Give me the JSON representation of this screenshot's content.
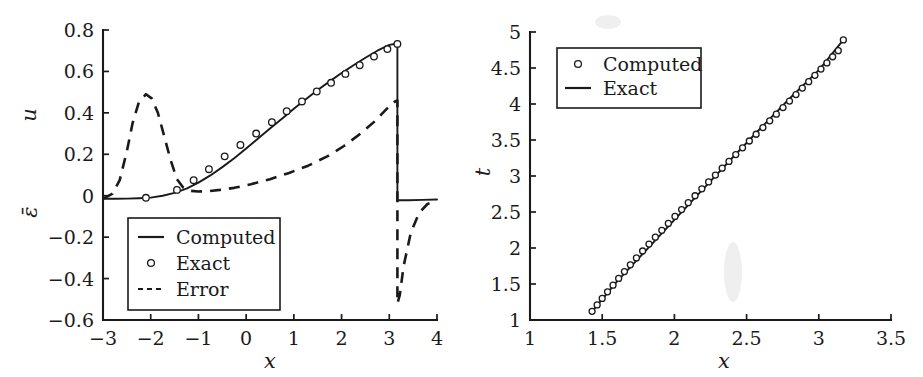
{
  "figure": {
    "background": "#ffffff",
    "ink": "#1a1a1a",
    "panel_count": 2
  },
  "chart_data": [
    {
      "type": "line",
      "panel": "left",
      "title": "",
      "xlabel": "x",
      "ylabel": "u",
      "ylabel_secondary": "ε̄",
      "xlim": [
        -3,
        4
      ],
      "ylim": [
        -0.6,
        0.8
      ],
      "xticks": [
        -3,
        -2,
        -1,
        0,
        1,
        2,
        3,
        4
      ],
      "xticklabels": [
        "−3",
        "−2",
        "−1",
        "0",
        "1",
        "2",
        "3",
        "4"
      ],
      "yticks": [
        -0.6,
        -0.4,
        -0.2,
        0,
        0.2,
        0.4,
        0.6,
        0.8
      ],
      "yticklabels": [
        "−0.6",
        "−0.4",
        "−0.2",
        "0",
        "0.2",
        "0.4",
        "0.6",
        "0.8"
      ],
      "grid": false,
      "legend_position": "lower-left",
      "series": [
        {
          "name": "Computed",
          "style": "solid",
          "marker": "none",
          "x": [
            -3.0,
            -2.75,
            -2.5,
            -2.25,
            -2.0,
            -1.75,
            -1.5,
            -1.25,
            -1.0,
            -0.75,
            -0.5,
            -0.25,
            0.0,
            0.25,
            0.5,
            0.75,
            1.0,
            1.25,
            1.5,
            1.75,
            2.0,
            2.25,
            2.5,
            2.75,
            3.0,
            3.17,
            3.17,
            3.4,
            3.7,
            4.0
          ],
          "y": [
            -0.015,
            -0.015,
            -0.014,
            -0.012,
            -0.009,
            0.0,
            0.014,
            0.034,
            0.063,
            0.098,
            0.138,
            0.181,
            0.228,
            0.276,
            0.324,
            0.372,
            0.42,
            0.466,
            0.51,
            0.552,
            0.592,
            0.63,
            0.666,
            0.7,
            0.728,
            0.735,
            -0.022,
            -0.022,
            -0.02,
            -0.018
          ]
        },
        {
          "name": "Exact",
          "style": "none",
          "marker": "circle",
          "x": [
            -2.1,
            -1.45,
            -1.1,
            -0.78,
            -0.45,
            -0.12,
            0.21,
            0.54,
            0.85,
            1.17,
            1.48,
            1.78,
            2.08,
            2.38,
            2.68,
            2.96,
            3.17
          ],
          "y": [
            -0.01,
            0.028,
            0.075,
            0.128,
            0.19,
            0.245,
            0.3,
            0.355,
            0.408,
            0.455,
            0.503,
            0.545,
            0.588,
            0.63,
            0.672,
            0.708,
            0.733
          ]
        },
        {
          "name": "Error",
          "style": "dashed",
          "marker": "none",
          "x": [
            -3.0,
            -2.8,
            -2.65,
            -2.5,
            -2.38,
            -2.25,
            -2.1,
            -1.98,
            -1.85,
            -1.72,
            -1.58,
            -1.45,
            -1.32,
            -1.18,
            -1.0,
            -0.8,
            -0.55,
            -0.25,
            0.1,
            0.5,
            0.9,
            1.3,
            1.7,
            2.05,
            2.4,
            2.7,
            2.95,
            3.12,
            3.17,
            3.17,
            3.22,
            3.3,
            3.45,
            3.62,
            3.8,
            4.0
          ],
          "y": [
            -0.015,
            0.01,
            0.075,
            0.215,
            0.35,
            0.45,
            0.49,
            0.47,
            0.4,
            0.29,
            0.17,
            0.08,
            0.04,
            0.024,
            0.02,
            0.022,
            0.028,
            0.038,
            0.055,
            0.08,
            0.11,
            0.145,
            0.19,
            0.24,
            0.3,
            0.36,
            0.42,
            0.455,
            0.46,
            -0.52,
            -0.48,
            -0.34,
            -0.18,
            -0.085,
            -0.04,
            -0.025
          ]
        }
      ]
    },
    {
      "type": "line",
      "panel": "right",
      "title": "",
      "xlabel": "x",
      "ylabel": "t",
      "xlim": [
        1,
        3.5
      ],
      "ylim": [
        1,
        5
      ],
      "xticks": [
        1,
        1.5,
        2,
        2.5,
        3,
        3.5
      ],
      "xticklabels": [
        "1",
        "1.5",
        "2",
        "2.5",
        "3",
        "3.5"
      ],
      "yticks": [
        1,
        1.5,
        2,
        2.5,
        3,
        3.5,
        4,
        4.5,
        5
      ],
      "yticklabels": [
        "1",
        "1.5",
        "2",
        "2.5",
        "3",
        "3.5",
        "4",
        "4.5",
        "5"
      ],
      "grid": false,
      "legend_position": "upper-left",
      "series": [
        {
          "name": "Computed",
          "style": "none",
          "marker": "circle",
          "x": [
            1.43,
            1.465,
            1.5,
            1.537,
            1.575,
            1.614,
            1.654,
            1.695,
            1.737,
            1.78,
            1.824,
            1.868,
            1.913,
            1.958,
            2.004,
            2.05,
            2.096,
            2.143,
            2.19,
            2.237,
            2.284,
            2.331,
            2.378,
            2.425,
            2.472,
            2.519,
            2.566,
            2.613,
            2.66,
            2.706,
            2.752,
            2.797,
            2.842,
            2.886,
            2.93,
            2.973,
            3.015,
            3.056,
            3.096,
            3.135,
            3.17
          ],
          "y": [
            1.12,
            1.21,
            1.3,
            1.392,
            1.484,
            1.578,
            1.672,
            1.767,
            1.862,
            1.958,
            2.054,
            2.15,
            2.246,
            2.342,
            2.438,
            2.534,
            2.63,
            2.726,
            2.822,
            2.918,
            3.013,
            3.108,
            3.203,
            3.298,
            3.392,
            3.486,
            3.58,
            3.673,
            3.766,
            3.858,
            3.95,
            4.041,
            4.131,
            4.221,
            4.31,
            4.398,
            4.485,
            4.571,
            4.656,
            4.74,
            4.89
          ]
        },
        {
          "name": "Exact",
          "style": "solid",
          "marker": "none",
          "x": [
            1.43,
            1.6,
            1.8,
            2.0,
            2.2,
            2.4,
            2.6,
            2.8,
            3.0,
            3.17
          ],
          "y": [
            1.12,
            1.53,
            1.96,
            2.39,
            2.82,
            3.25,
            3.67,
            4.08,
            4.47,
            4.89
          ]
        }
      ]
    }
  ],
  "panels": {
    "left": {
      "name": "left-plot",
      "xlabel": "x",
      "ylabel_top": "u",
      "ylabel_bottom": "ε̄",
      "yticklabels": [
        "0.8",
        "0.6",
        "0.4",
        "0.2",
        "0",
        "−0.2",
        "−0.4",
        "−0.6"
      ],
      "xticklabels": [
        "−3",
        "−2",
        "−1",
        "0",
        "1",
        "2",
        "3",
        "4"
      ],
      "legend": {
        "entries": [
          {
            "label": "Computed",
            "style": "solid-line"
          },
          {
            "label": "Exact",
            "style": "circle-marker"
          },
          {
            "label": "Error",
            "style": "dashed-line"
          }
        ]
      }
    },
    "right": {
      "name": "right-plot",
      "xlabel": "x",
      "ylabel": "t",
      "yticklabels": [
        "5",
        "4.5",
        "4",
        "3.5",
        "3",
        "2.5",
        "2",
        "1.5",
        "1"
      ],
      "xticklabels": [
        "1",
        "1.5",
        "2",
        "2.5",
        "3",
        "3.5"
      ],
      "legend": {
        "entries": [
          {
            "label": "Computed",
            "style": "circle-marker"
          },
          {
            "label": "Exact",
            "style": "solid-line"
          }
        ]
      }
    }
  }
}
